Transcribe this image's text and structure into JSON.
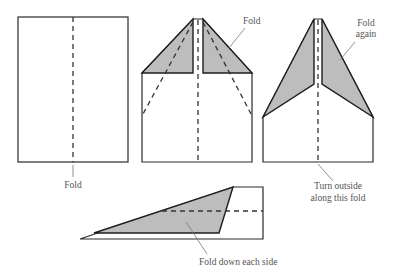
{
  "diagram": {
    "shade_color": "#bdbdbd",
    "line_color": "#2a2a2a",
    "steps": [
      {
        "id": "step-1",
        "label": "Fold"
      },
      {
        "id": "step-2",
        "label": "Fold"
      },
      {
        "id": "step-3",
        "label_lines": [
          "Fold",
          "again"
        ],
        "bottom_label_lines": [
          "Turn outside",
          "along this fold"
        ]
      },
      {
        "id": "step-4",
        "label": "Fold down each side"
      }
    ]
  }
}
